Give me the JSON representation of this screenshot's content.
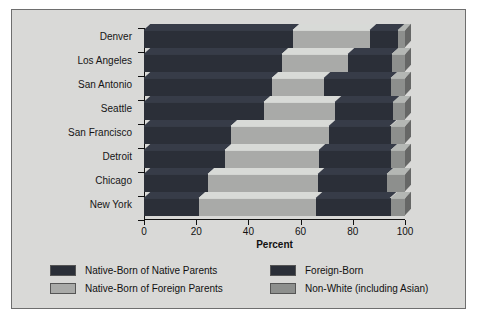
{
  "chart_data": {
    "type": "bar",
    "orientation": "horizontal",
    "stacked": true,
    "title": "",
    "xlabel": "Percent",
    "ylabel": "",
    "xlim": [
      0,
      100
    ],
    "xticks": [
      0,
      20,
      40,
      60,
      80,
      100
    ],
    "grid": false,
    "legend_position": "bottom",
    "categories": [
      "Denver",
      "Los Angeles",
      "San Antonio",
      "Seattle",
      "San Francisco",
      "Detroit",
      "Chicago",
      "New York"
    ],
    "series": [
      {
        "name": "Native-Born of Native Parents",
        "color": "#2b2f38",
        "values": [
          57,
          53,
          49,
          46,
          33.5,
          31,
          24.5,
          21
        ]
      },
      {
        "name": "Native-Born of Foreign Parents",
        "color": "#a9aaa8",
        "values": [
          29.5,
          25,
          20,
          27,
          37.5,
          36,
          42,
          45
        ]
      },
      {
        "name": "Foreign-Born",
        "color": "#2b2f38",
        "values": [
          11,
          17,
          25.5,
          22.5,
          23.5,
          27.5,
          26.5,
          28.5
        ]
      },
      {
        "name": "Non-White (including Asian)",
        "color": "#8d8f8d",
        "values": [
          2.5,
          5,
          5.5,
          4.5,
          5.5,
          5.5,
          7,
          5.5
        ]
      }
    ]
  },
  "axis": {
    "x_tick_labels": [
      "0",
      "20",
      "40",
      "60",
      "80",
      "100"
    ],
    "x_title": "Percent"
  },
  "legend": {
    "items": [
      {
        "label": "Native-Born of Native Parents",
        "color": "#2b2f38"
      },
      {
        "label": "Native-Born of Foreign Parents",
        "color": "#a9aaa8"
      },
      {
        "label": "Foreign-Born",
        "color": "#2b2f38"
      },
      {
        "label": "Non-White (including Asian)",
        "color": "#8d8f8d"
      }
    ]
  }
}
